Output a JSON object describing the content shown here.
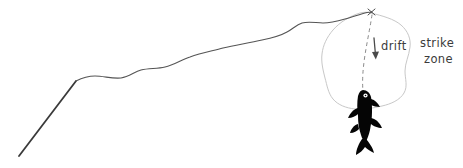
{
  "scene": {
    "title": "fly fishing drift and strike zone diagram",
    "background_color": "#ffffff"
  },
  "labels": {
    "drift": "drift",
    "strike": "strike",
    "zone": "zone"
  },
  "colors": {
    "rod": "#3a3a3a",
    "line": "#555555",
    "strike_zone_outline": "#c8c8c8",
    "drift_dashed": "#8a8a8a",
    "drift_arrow": "#4a4a4a",
    "fish_body": "#050505",
    "fish_eye": "#ffffff",
    "text": "#3b3b3b"
  },
  "elements": {
    "rod_name": "fishing-rod",
    "line_name": "fishing-line",
    "strike_zone_name": "strike-zone-outline",
    "drift_path_name": "drift-dashed-path",
    "drift_arrow_name": "drift-arrow",
    "fish_name": "fish-silhouette",
    "line_tip_name": "line-tip-marker"
  },
  "geometry": {
    "rod_start": [
      19,
      156
    ],
    "rod_end": [
      76,
      81
    ],
    "line_tip": [
      372,
      12
    ],
    "drift_arrow_start": [
      374,
      38
    ],
    "drift_arrow_end": [
      375,
      59
    ],
    "fish_center": [
      367,
      112
    ],
    "strike_zone_bounds": [
      322,
      18,
      412,
      110
    ]
  }
}
